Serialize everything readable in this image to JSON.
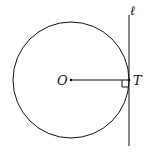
{
  "diagram": {
    "labels": {
      "center": "O",
      "tangent_point": "T",
      "line": "ℓ"
    },
    "circle": {
      "cx": 71,
      "cy": 80,
      "r": 58
    },
    "tangent_line": {
      "x": 129,
      "y1": 15,
      "y2": 146
    },
    "radius_segment": {
      "x1": 71,
      "x2": 129,
      "y": 80
    },
    "stroke_color": "#111111"
  }
}
